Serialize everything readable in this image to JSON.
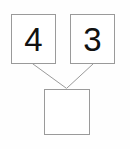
{
  "diagram": {
    "kind": "number-bond",
    "background_color": "#fefefe",
    "border_color": "#9a9a9a",
    "connector_color": "#9a9a9a",
    "text_color": "#111111",
    "parts": [
      {
        "id": "part-left",
        "label": "4",
        "filled": true
      },
      {
        "id": "part-right",
        "label": "3",
        "filled": true
      }
    ],
    "whole": {
      "id": "whole",
      "label": "",
      "filled": false
    },
    "connectors": [
      {
        "id": "connector-left",
        "from": "part-left",
        "to": "whole",
        "x1": 33,
        "y1": 64,
        "x2": 66,
        "y2": 88
      },
      {
        "id": "connector-right",
        "from": "part-right",
        "to": "whole",
        "x1": 93,
        "y1": 64,
        "x2": 67,
        "y2": 88
      }
    ]
  }
}
